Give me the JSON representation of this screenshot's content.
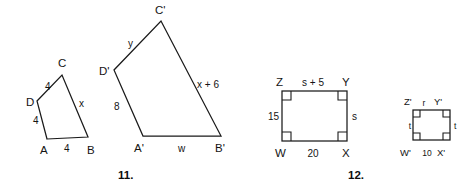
{
  "sheet": {
    "width": 467,
    "height": 192,
    "background": "#ffffff",
    "ink": "#1a1a1a"
  },
  "problems": [
    {
      "number": "11.",
      "caption_x": 127,
      "caption_y": 179,
      "description": "Pair of similar quadrilaterals ABCD and A'B'C'D'",
      "figures": [
        {
          "name": "quadrilateral-abcd",
          "vertices": [
            {
              "label": "A",
              "x": 47,
              "y": 139,
              "lx": 40,
              "ly": 154
            },
            {
              "label": "B",
              "x": 88,
              "y": 137,
              "lx": 87,
              "ly": 154
            },
            {
              "label": "C",
              "x": 62,
              "y": 75,
              "lx": 58,
              "ly": 67
            },
            {
              "label": "D",
              "x": 37,
              "y": 101,
              "lx": 26,
              "ly": 106
            }
          ],
          "sides": [
            {
              "label": "4",
              "lx": 45,
              "ly": 90,
              "from": "D",
              "to": "C"
            },
            {
              "label": "x",
              "lx": 79,
              "ly": 107,
              "from": "C",
              "to": "B"
            },
            {
              "label": "4",
              "lx": 64,
              "ly": 152,
              "from": "A",
              "to": "B"
            },
            {
              "label": "4",
              "lx": 33,
              "ly": 124,
              "from": "D",
              "to": "A"
            }
          ]
        },
        {
          "name": "quadrilateral-a-prime-b-prime-c-prime-d-prime",
          "vertices": [
            {
              "label": "A'",
              "x": 143,
              "y": 136,
              "lx": 134,
              "ly": 152
            },
            {
              "label": "B'",
              "x": 221,
              "y": 136,
              "lx": 216,
              "ly": 152
            },
            {
              "label": "C'",
              "x": 161,
              "y": 21,
              "lx": 156,
              "ly": 14
            },
            {
              "label": "D'",
              "x": 114,
              "y": 70,
              "lx": 100,
              "ly": 75
            }
          ],
          "sides": [
            {
              "label": "y",
              "lx": 131,
              "ly": 47,
              "from": "D'",
              "to": "C'"
            },
            {
              "label": "x + 6",
              "lx": 197,
              "ly": 88,
              "from": "C'",
              "to": "B'"
            },
            {
              "label": "w",
              "lx": 181,
              "ly": 152,
              "from": "A'",
              "to": "B'"
            },
            {
              "label": "8",
              "lx": 117,
              "ly": 110,
              "from": "D'",
              "to": "A'"
            }
          ]
        }
      ]
    },
    {
      "number": "12.",
      "caption_x": 357,
      "caption_y": 179,
      "description": "Pair of similar rectangles WXYZ and W'X'Y'Z'",
      "figures": [
        {
          "name": "rectangle-wxyz",
          "box": {
            "x": 282,
            "y": 91,
            "w": 65,
            "h": 50
          },
          "right_angle_mark_size": 9,
          "vertices": [
            {
              "label": "Z",
              "lx": 279,
              "ly": 86
            },
            {
              "label": "Y",
              "lx": 344,
              "ly": 86
            },
            {
              "label": "W",
              "lx": 279,
              "ly": 156
            },
            {
              "label": "X",
              "lx": 345,
              "ly": 156
            }
          ],
          "sides": [
            {
              "label": "s + 5",
              "lx": 314,
              "ly": 85,
              "side": "top"
            },
            {
              "label": "s",
              "lx": 355,
              "ly": 120,
              "side": "right"
            },
            {
              "label": "20",
              "lx": 314,
              "ly": 156,
              "side": "bottom"
            },
            {
              "label": "15",
              "lx": 272,
              "ly": 119,
              "side": "left"
            }
          ]
        },
        {
          "name": "rectangle-w-prime-x-prime-y-prime-z-prime",
          "box": {
            "x": 413,
            "y": 110,
            "w": 37,
            "h": 30
          },
          "right_angle_mark_size": 7,
          "vertices": [
            {
              "label": "Z'",
              "lx": 406,
              "ly": 104
            },
            {
              "label": "Y'",
              "lx": 437,
              "ly": 104
            },
            {
              "label": "W'",
              "lx": 403,
              "ly": 152
            },
            {
              "label": "X'",
              "lx": 441,
              "ly": 152
            }
          ],
          "sides": [
            {
              "label": "r",
              "lx": 424,
              "ly": 105,
              "side": "top"
            },
            {
              "label": "t",
              "lx": 456,
              "ly": 128,
              "side": "right"
            },
            {
              "label": "t",
              "lx": 407,
              "ly": 128,
              "side": "left"
            },
            {
              "label": "10",
              "lx": 426,
              "ly": 152,
              "side": "bottom"
            }
          ]
        }
      ]
    }
  ]
}
